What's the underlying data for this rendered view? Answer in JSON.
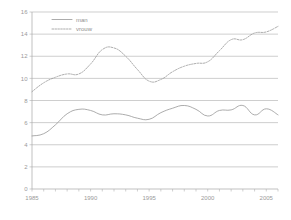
{
  "chart_data": {
    "type": "line",
    "title": "",
    "xlabel": "",
    "ylabel": "",
    "xlim": [
      1985,
      2006
    ],
    "ylim": [
      0,
      16
    ],
    "ytick_step": 2,
    "grid": "horizontal",
    "legend_position": "upper-left-inside",
    "yticks": [
      "0",
      "2",
      "4",
      "6",
      "8",
      "10",
      "12",
      "14",
      "16"
    ],
    "ytick_values": [
      0,
      2,
      4,
      6,
      8,
      10,
      12,
      14,
      16
    ],
    "xticks": [
      "1985",
      "1990",
      "1995",
      "2000",
      "2005"
    ],
    "xtick_values": [
      1985,
      1990,
      1995,
      2000,
      2005
    ],
    "x": [
      1985,
      1986,
      1987,
      1988,
      1989,
      1990,
      1991,
      1992,
      1993,
      1994,
      1995,
      1996,
      1997,
      1998,
      1999,
      2000,
      2001,
      2002,
      2003,
      2004,
      2005,
      2006
    ],
    "series": [
      {
        "name": "man",
        "style": "solid",
        "color": "#9d9d9d",
        "values": [
          4.8,
          5.0,
          5.8,
          6.8,
          7.2,
          7.1,
          6.7,
          6.8,
          6.7,
          6.4,
          6.3,
          6.9,
          7.3,
          7.55,
          7.2,
          6.6,
          7.1,
          7.15,
          7.55,
          6.7,
          7.25,
          6.7
        ]
      },
      {
        "name": "vrouw",
        "style": "dotted",
        "color": "#9d9d9d",
        "values": [
          8.8,
          9.6,
          10.1,
          10.4,
          10.4,
          11.3,
          12.6,
          12.75,
          12.0,
          10.8,
          9.75,
          9.9,
          10.6,
          11.1,
          11.35,
          11.5,
          12.5,
          13.5,
          13.5,
          14.1,
          14.2,
          14.7
        ]
      }
    ],
    "legend": [
      {
        "label": "man",
        "style": "solid"
      },
      {
        "label": "vrouw",
        "style": "dotted"
      }
    ]
  },
  "colors": {
    "grid": "#b9b9b9",
    "axis": "#a8a8a8",
    "text": "#9a9a9a",
    "series": "#9d9d9d",
    "background": "#ffffff"
  }
}
